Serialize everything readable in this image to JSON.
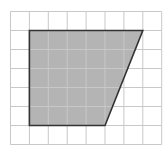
{
  "diagram": {
    "type": "grid-figure",
    "grid": {
      "columns": 8,
      "rows": 7,
      "origin_x": 10.5,
      "origin_y": 11.5,
      "cell_width": 18.9,
      "cell_height": 19.0,
      "line_color": "#c8c8c8",
      "background": "#ffffff"
    },
    "shape": {
      "name": "trapezoid",
      "vertices_grid": [
        [
          1,
          1
        ],
        [
          7,
          1
        ],
        [
          5,
          6
        ],
        [
          1,
          6
        ]
      ],
      "fill_color": "#b4b4b4",
      "stroke_color": "#333333",
      "top_length_units": 6,
      "bottom_length_units": 4,
      "height_units": 5
    }
  }
}
